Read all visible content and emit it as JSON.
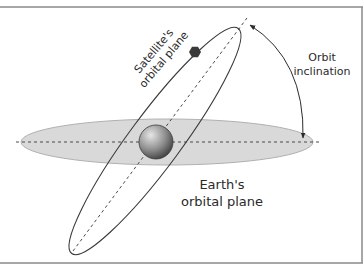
{
  "diagram": {
    "type": "orbital-inclination",
    "labels": {
      "satellite_plane": {
        "line1": "Satellite's",
        "line2": "orbital plane"
      },
      "inclination": {
        "line1": "Orbit",
        "line2": "inclination"
      },
      "earth_plane": {
        "line1": "Earth's",
        "line2": "orbital plane"
      }
    },
    "colors": {
      "frame": "#8a8a8a",
      "earth_plane_fill": "#d9d9d9",
      "earth_plane_stroke": "#b0b0b0",
      "orbit_stroke": "#3a3a3a",
      "dashed_line": "#4a4a4a",
      "earth_light": "#d8d8d8",
      "earth_dark": "#3c3c3c",
      "satellite": "#3a3a3a",
      "arrow": "#2a2a2a"
    },
    "icons": {
      "earth": "sphere-icon",
      "satellite": "hexagon-satellite-icon"
    }
  }
}
